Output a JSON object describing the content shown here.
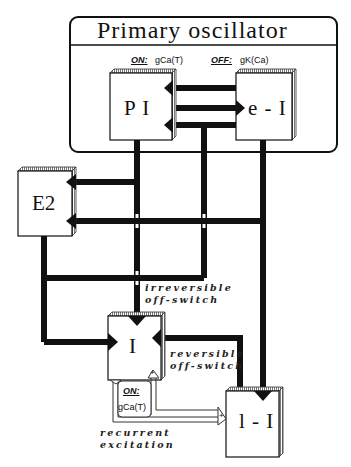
{
  "diagram": {
    "title": "Primary oscillator",
    "oscillator_on_label": "ON:",
    "oscillator_on_value": "gCa(T)",
    "oscillator_off_label": "OFF:",
    "oscillator_off_value": "gK(Ca)",
    "nodes": {
      "pi": "P I",
      "ei": "e - I",
      "e2": "E2",
      "i": "I",
      "li": "l - I"
    },
    "annotations": {
      "irreversible_line1": "irreversible",
      "irreversible_line2": "off-switch",
      "reversible_line1": "reversible",
      "reversible_line2": "off-switch",
      "recurrent_line1": "recurrent",
      "recurrent_line2": "excitation",
      "i_on_label": "ON:",
      "i_on_value": "gCa(T)",
      "plus_sign": "+"
    },
    "colors": {
      "line": "#111111",
      "box_fill": "#ffffff",
      "box_shadow": "#bbbbbb"
    }
  }
}
